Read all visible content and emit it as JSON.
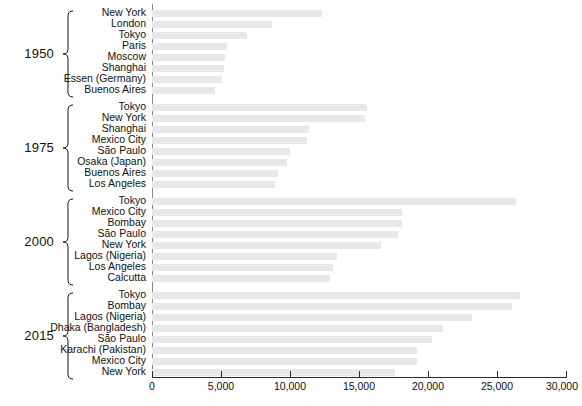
{
  "chart_data": {
    "type": "bar",
    "orientation": "horizontal",
    "title": "",
    "xlabel": "",
    "ylabel": "",
    "xlim": [
      0,
      30000
    ],
    "grid": false,
    "legend": false,
    "tick_labels": [
      "0",
      "5,000",
      "10,000",
      "15,000",
      "20,000",
      "25,000",
      "30,000"
    ],
    "tick_values": [
      0,
      5000,
      10000,
      15000,
      20000,
      25000,
      30000
    ],
    "bar_color": "#e8e8e8",
    "axis_color": "#2b2b2b",
    "groups": [
      {
        "year": "1950",
        "categories": [
          "New York",
          "London",
          "Tokyo",
          "Paris",
          "Moscow",
          "Shanghai",
          "Essen (Germany)",
          "Buenos Aires"
        ],
        "values": [
          12300,
          8700,
          6900,
          5400,
          5300,
          5200,
          5100,
          4600
        ]
      },
      {
        "year": "1975",
        "categories": [
          "Tokyo",
          "New York",
          "Shanghai",
          "Mexico City",
          "São Paulo",
          "Osaka (Japan)",
          "Buenos Aires",
          "Los Angeles"
        ],
        "values": [
          15600,
          15400,
          11400,
          11200,
          10000,
          9800,
          9100,
          8900
        ]
      },
      {
        "year": "2000",
        "categories": [
          "Tokyo",
          "Mexico City",
          "Bombay",
          "São Paulo",
          "New York",
          "Lagos (Nigeria)",
          "Los Angeles",
          "Calcutta"
        ],
        "values": [
          26400,
          18100,
          18100,
          17800,
          16600,
          13400,
          13100,
          12900
        ]
      },
      {
        "year": "2015",
        "categories": [
          "Tokyo",
          "Bombay",
          "Lagos (Nigeria)",
          "Dhaka (Bangladesh)",
          "São Paulo",
          "Karachi (Pakistan)",
          "Mexico City",
          "New York"
        ],
        "values": [
          26700,
          26100,
          23200,
          21100,
          20300,
          19200,
          19200,
          17600
        ]
      }
    ]
  }
}
